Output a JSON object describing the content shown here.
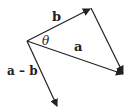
{
  "diagram": {
    "labels": {
      "b": "b",
      "a": "a",
      "theta": "θ",
      "a_minus_b": "a – b"
    },
    "stroke_color": "#222222"
  }
}
